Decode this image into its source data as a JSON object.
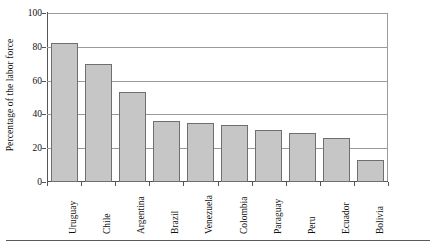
{
  "chart_data": {
    "type": "bar",
    "title": "",
    "subtitle": "",
    "xlabel": "",
    "ylabel": "Percentage of the labor force",
    "categories": [
      "Uruguay",
      "Chile",
      "Argentina",
      "Brazil",
      "Venezuela",
      "Colombia",
      "Paraguay",
      "Peru",
      "Ecuador",
      "Bolivia"
    ],
    "values": [
      82,
      70,
      53,
      36,
      35,
      34,
      31,
      29,
      26,
      13
    ],
    "ylim": [
      0,
      100
    ],
    "yticks": [
      0,
      20,
      40,
      60,
      80,
      100
    ],
    "ytick_labels": [
      "0",
      "20",
      "40",
      "60",
      "80",
      "100"
    ],
    "grid": "horizontal",
    "legend": "none",
    "bar_color": "#c6c6c6",
    "bar_edge_color": "#6f6f6f",
    "axis_color": "#555555",
    "gridline_color": "#9a9a9a",
    "orientation": "vertical",
    "xlabel_rotation": 90
  }
}
